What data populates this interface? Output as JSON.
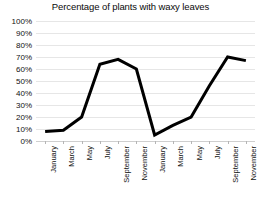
{
  "chart_data": {
    "type": "line",
    "title": "Percentage of plants with waxy leaves",
    "xlabel": "",
    "ylabel": "",
    "ylim": [
      0,
      100
    ],
    "ytick_labels": [
      "100%",
      "90%",
      "80%",
      "70%",
      "60%",
      "50%",
      "40%",
      "30%",
      "20%",
      "10%",
      "0%"
    ],
    "ytick_values": [
      100,
      90,
      80,
      70,
      60,
      50,
      40,
      30,
      20,
      10,
      0
    ],
    "grid": true,
    "legend": false,
    "legend_position": "none",
    "categories": [
      "January",
      "March",
      "May",
      "July",
      "September",
      "November",
      "January",
      "March",
      "May",
      "July",
      "September",
      "November"
    ],
    "values": [
      8,
      9,
      20,
      64,
      68,
      60,
      5,
      13,
      20,
      46,
      70,
      67
    ],
    "series": [
      {
        "name": "Percentage of plants with waxy leaves",
        "values": [
          8,
          9,
          20,
          64,
          68,
          60,
          5,
          13,
          20,
          46,
          70,
          67
        ],
        "color": "#000000"
      }
    ]
  },
  "colors": {
    "line": "#000000",
    "gridline": "#e6e6e6",
    "axis": "#cfcfcf",
    "text": "#111111",
    "background": "#ffffff"
  }
}
